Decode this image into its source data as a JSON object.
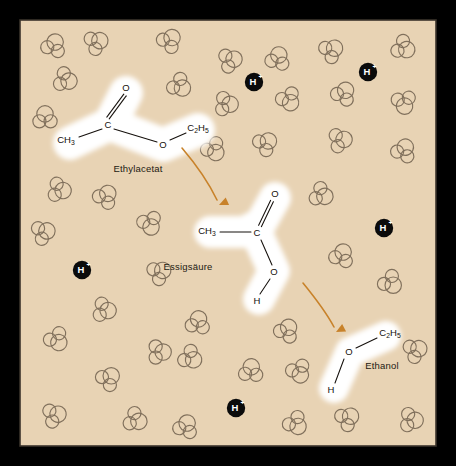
{
  "figure": {
    "name": "acid-catalysed-ester-hydrolysis",
    "caption_language": "de",
    "panel": {
      "background_color": "#e8d3b4",
      "border_color": "#3a332b",
      "outer_background": "#fdfdfb",
      "x": 20,
      "y": 20,
      "width": 416,
      "height": 426
    }
  },
  "colors": {
    "panel_background": "#e8d3b4",
    "panel_border": "#3a332b",
    "water_outline": "#80705c",
    "molecule_highlight": "#ffffff",
    "bond_color": "#15100c",
    "arrow_color": "#c8822a",
    "proton_fill": "#0b0b0b",
    "proton_text": "#ffffff",
    "label_text": "#231a12"
  },
  "molecules": [
    {
      "id": "ethyl-acetate",
      "label": "Ethylacetat",
      "label_x": 138,
      "label_y": 172,
      "atoms": [
        {
          "name": "methyl",
          "text": "CH",
          "sub": "3",
          "x": 66,
          "y": 140
        },
        {
          "name": "carbonyl-carbon",
          "text": "C",
          "sub": "",
          "x": 108,
          "y": 125
        },
        {
          "name": "carbonyl-oxygen",
          "text": "O",
          "sub": "",
          "x": 126,
          "y": 88
        },
        {
          "name": "ester-oxygen",
          "text": "O",
          "sub": "",
          "x": 163,
          "y": 145
        },
        {
          "name": "ethyl-group",
          "text": "C",
          "sub": "2",
          "text2": "H",
          "sub2": "5",
          "x": 198,
          "y": 128
        }
      ]
    },
    {
      "id": "acetic-acid",
      "label": "Essigsäure",
      "label_x": 188,
      "label_y": 270,
      "atoms": [
        {
          "name": "methyl",
          "text": "CH",
          "sub": "3",
          "x": 207,
          "y": 231
        },
        {
          "name": "carboxyl-carbon",
          "text": "C",
          "sub": "",
          "x": 257,
          "y": 233
        },
        {
          "name": "carbonyl-oxygen",
          "text": "O",
          "sub": "",
          "x": 275,
          "y": 194
        },
        {
          "name": "hydroxyl-oxygen",
          "text": "O",
          "sub": "",
          "x": 274,
          "y": 272
        },
        {
          "name": "hydroxyl-hydrogen",
          "text": "H",
          "sub": "",
          "x": 257,
          "y": 301
        }
      ]
    },
    {
      "id": "ethanol",
      "label": "Ethanol",
      "label_x": 382,
      "label_y": 369,
      "atoms": [
        {
          "name": "ethyl-group",
          "text": "C",
          "sub": "2",
          "text2": "H",
          "sub2": "5",
          "x": 390,
          "y": 333
        },
        {
          "name": "hydroxyl-oxygen",
          "text": "O",
          "sub": "",
          "x": 349,
          "y": 352
        },
        {
          "name": "hydroxyl-hydrogen",
          "text": "H",
          "sub": "",
          "x": 331,
          "y": 390
        }
      ]
    }
  ],
  "protons": [
    {
      "id": "proton-top-center",
      "label": "H",
      "charge": "+",
      "cx": 254,
      "cy": 82
    },
    {
      "id": "proton-top-right",
      "label": "H",
      "charge": "+",
      "cx": 368,
      "cy": 72
    },
    {
      "id": "proton-mid-right",
      "label": "H",
      "charge": "+",
      "cx": 384,
      "cy": 228
    },
    {
      "id": "proton-mid-left",
      "label": "H",
      "charge": "+",
      "cx": 82,
      "cy": 270
    },
    {
      "id": "proton-bottom",
      "label": "H",
      "charge": "+",
      "cx": 236,
      "cy": 408
    }
  ],
  "arrows": [
    {
      "id": "arrow-ester-to-acid",
      "from": "ethyl-acetate",
      "to": "acetic-acid",
      "path": "M 182 148 Q 205 175 217 200",
      "tip_x": 219,
      "tip_y": 205,
      "tip_angle": 66
    },
    {
      "id": "arrow-acid-to-ethanol",
      "from": "acetic-acid",
      "to": "ethanol",
      "path": "M 303 283 Q 325 310 334 327",
      "tip_x": 336,
      "tip_y": 332,
      "tip_angle": 62
    }
  ],
  "water_molecules": [
    {
      "cx": 54,
      "cy": 45,
      "rot": 20
    },
    {
      "cx": 97,
      "cy": 42,
      "rot": 65
    },
    {
      "cx": 66,
      "cy": 80,
      "rot": 110
    },
    {
      "cx": 45,
      "cy": 117,
      "rot": 0
    },
    {
      "cx": 170,
      "cy": 40,
      "rot": 40
    },
    {
      "cx": 180,
      "cy": 86,
      "rot": 130
    },
    {
      "cx": 231,
      "cy": 60,
      "rot": 75
    },
    {
      "cx": 278,
      "cy": 58,
      "rot": 15
    },
    {
      "cx": 289,
      "cy": 100,
      "rot": 150
    },
    {
      "cx": 227,
      "cy": 104,
      "rot": 95
    },
    {
      "cx": 332,
      "cy": 50,
      "rot": 55
    },
    {
      "cx": 404,
      "cy": 48,
      "rot": 120
    },
    {
      "cx": 344,
      "cy": 93,
      "rot": 30
    },
    {
      "cx": 404,
      "cy": 103,
      "rot": 170
    },
    {
      "cx": 341,
      "cy": 140,
      "rot": 80
    },
    {
      "cx": 404,
      "cy": 150,
      "rot": 25
    },
    {
      "cx": 214,
      "cy": 150,
      "rot": 145
    },
    {
      "cx": 266,
      "cy": 143,
      "rot": 50
    },
    {
      "cx": 60,
      "cy": 190,
      "rot": 100
    },
    {
      "cx": 106,
      "cy": 196,
      "rot": 35
    },
    {
      "cx": 150,
      "cy": 224,
      "rot": 160
    },
    {
      "cx": 44,
      "cy": 232,
      "rot": 70
    },
    {
      "cx": 322,
      "cy": 195,
      "rot": 115
    },
    {
      "cx": 342,
      "cy": 255,
      "rot": 20
    },
    {
      "cx": 391,
      "cy": 283,
      "rot": 135
    },
    {
      "cx": 160,
      "cy": 272,
      "rot": 60
    },
    {
      "cx": 105,
      "cy": 310,
      "rot": 100
    },
    {
      "cx": 198,
      "cy": 322,
      "rot": 10
    },
    {
      "cx": 57,
      "cy": 340,
      "rot": 145
    },
    {
      "cx": 109,
      "cy": 378,
      "rot": 45
    },
    {
      "cx": 160,
      "cy": 352,
      "rot": 90
    },
    {
      "cx": 191,
      "cy": 358,
      "rot": 125
    },
    {
      "cx": 287,
      "cy": 330,
      "rot": 30
    },
    {
      "cx": 299,
      "cy": 372,
      "rot": 155
    },
    {
      "cx": 55,
      "cy": 415,
      "rot": 75
    },
    {
      "cx": 136,
      "cy": 420,
      "rot": 115
    },
    {
      "cx": 186,
      "cy": 426,
      "rot": 20
    },
    {
      "cx": 296,
      "cy": 424,
      "rot": 140
    },
    {
      "cx": 348,
      "cy": 418,
      "rot": 55
    },
    {
      "cx": 412,
      "cy": 420,
      "rot": 95
    },
    {
      "cx": 416,
      "cy": 350,
      "rot": 65
    },
    {
      "cx": 251,
      "cy": 370,
      "rot": 5
    }
  ]
}
